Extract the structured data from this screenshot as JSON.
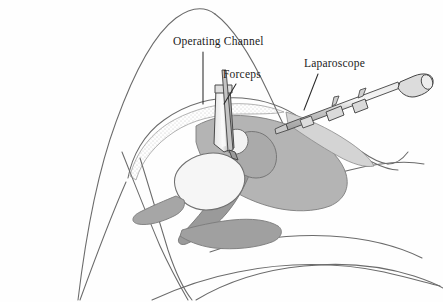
{
  "figure": {
    "kind": "medical-illustration",
    "view": "sagittal-section-female-pelvis",
    "procedure": "Laparoscopy",
    "background_color": "#fefefe",
    "line_color": "#555555",
    "ink_color": "#1b1b1b"
  },
  "labels": {
    "operating_channel": "Operating Channel",
    "forceps": "Forceps",
    "laparoscope": "Laparoscope"
  },
  "palette": {
    "outline": "#5a5a5a",
    "soft_tissue_light": "#d2d2d2",
    "soft_tissue_mid": "#b0b0b0",
    "soft_tissue_dark": "#9a9a9a",
    "organ_fill": "#f2f2f2",
    "instrument_fill": "#cfcfcf",
    "instrument_edge": "#4a4a4a",
    "stipple": "#8c8c8c"
  },
  "anatomy": [
    {
      "name": "thigh-flexed",
      "shading": "none"
    },
    {
      "name": "abdominal-wall",
      "shading": "stippled"
    },
    {
      "name": "uterus",
      "shading": "soft_tissue_mid"
    },
    {
      "name": "bladder",
      "shading": "organ_fill"
    },
    {
      "name": "rectum",
      "shading": "soft_tissue_dark"
    },
    {
      "name": "sacrum-spine",
      "shading": "soft_tissue_light"
    },
    {
      "name": "buttock-contour",
      "shading": "none"
    }
  ],
  "instruments": [
    {
      "name": "operating-channel",
      "type": "trocar-cannula",
      "orientation": "vertical",
      "label": "Operating Channel"
    },
    {
      "name": "forceps",
      "type": "grasping-forceps",
      "orientation": "vertical-through-cannula",
      "label": "Forceps"
    },
    {
      "name": "laparoscope",
      "type": "rigid-endoscope",
      "orientation": "oblique-upper-right",
      "parts": [
        "shaft",
        "valve-port",
        "coupling",
        "light-post",
        "eyepiece"
      ],
      "label": "Laparoscope"
    }
  ]
}
